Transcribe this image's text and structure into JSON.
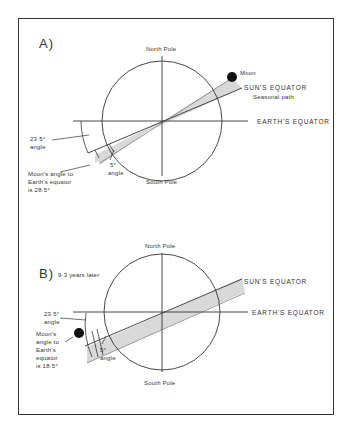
{
  "panel_a": {
    "label": "A)",
    "north_pole": "North Pole",
    "south_pole": "South Pole",
    "moon": "Moon",
    "sun_equator": "SUN'S EQUATOR",
    "seasonal_path": "Seasonal path",
    "earth_equator": "EARTH'S EQUATOR",
    "tilt_angle_1": "23·5°",
    "tilt_angle_2": "angle",
    "five_angle_1": "5°",
    "five_angle_2": "angle",
    "moon_angle_1": "Moon's angle to",
    "moon_angle_2": "Earth's equator",
    "moon_angle_3": "is 28·5°"
  },
  "panel_b": {
    "label": "B)",
    "subtitle": "9·3 years later",
    "north_pole": "North Pole",
    "south_pole": "South Pole",
    "sun_equator": "SUN'S EQUATOR",
    "earth_equator": "EARTH'S EQUATOR",
    "tilt_angle_1": "23·5°",
    "tilt_angle_2": "angle",
    "five_angle_1": "5°",
    "five_angle_2": "angle",
    "moon_angle_1": "Moon's",
    "moon_angle_2": "angle to",
    "moon_angle_3": "Earth's",
    "moon_angle_4": "equator",
    "moon_angle_5": "is 18·5°"
  },
  "colors": {
    "line": "#333333",
    "shade": "#d9d9d9",
    "moon": "#111111"
  }
}
